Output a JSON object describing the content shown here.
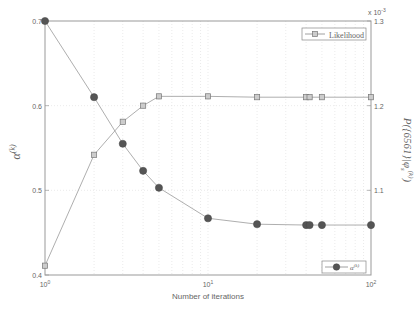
{
  "chart_data": {
    "type": "line",
    "title": "",
    "xlabel": "Number of iterations",
    "xscale": "log",
    "xlim": [
      1,
      100
    ],
    "xticks": [
      "10^0",
      "10^1",
      "10^2"
    ],
    "ylabel_left": "α^(k)",
    "ylim_left": [
      0.4,
      0.7
    ],
    "yticks_left": [
      "0.4",
      "0.5",
      "0.6",
      "0.7"
    ],
    "ylabel_right": "P({6561}|φ_s^(k))",
    "ylim_right": [
      1.0,
      1.3
    ],
    "yticks_right": [
      "1.1",
      "1.2",
      "1.3"
    ],
    "yright_multiplier": "x 10^-3",
    "grid": true,
    "series": [
      {
        "name": "α^(k)",
        "axis": "left",
        "marker": "circle",
        "legend_position": "lower right",
        "x": [
          1,
          2,
          3,
          4,
          5,
          10,
          20,
          40,
          42,
          50,
          100
        ],
        "values": [
          0.7,
          0.61,
          0.555,
          0.523,
          0.503,
          0.467,
          0.46,
          0.459,
          0.459,
          0.459,
          0.459
        ]
      },
      {
        "name": "Likelihood",
        "axis": "right",
        "marker": "square",
        "legend_position": "upper right",
        "x": [
          1,
          2,
          3,
          4,
          5,
          10,
          20,
          40,
          42,
          50,
          100
        ],
        "values": [
          1.011,
          1.142,
          1.181,
          1.2,
          1.211,
          1.211,
          1.21,
          1.21,
          1.21,
          1.21,
          1.21
        ]
      }
    ]
  },
  "labels": {
    "xlabel": "Number of iterations",
    "ylabel_left": "α",
    "ylabel_left_sup": "(k)",
    "ylabel_right": "P({6561}|φ",
    "ylabel_right_sub": "s",
    "ylabel_right_sup": "(k)",
    "ylabel_right_end": ")",
    "multiplier_base": "x 10",
    "multiplier_exp": "-3",
    "legend_top": "Likelihood",
    "legend_bottom_base": "α",
    "legend_bottom_sup": "(k)",
    "xtick_base": "10",
    "xtick_exps": [
      "0",
      "1",
      "2"
    ]
  }
}
